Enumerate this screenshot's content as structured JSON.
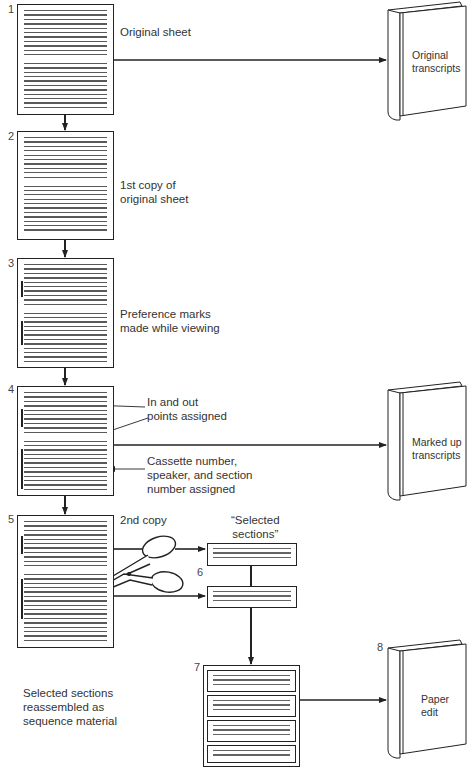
{
  "diagram": {
    "steps": [
      {
        "number": "1",
        "label": "Original sheet"
      },
      {
        "number": "2",
        "label_lines": [
          "1st copy of",
          "original sheet"
        ]
      },
      {
        "number": "3",
        "label_lines": [
          "Preference marks",
          "made while viewing"
        ]
      },
      {
        "number": "4",
        "annotations": [
          {
            "lines": [
              "In and out",
              "points assigned"
            ]
          },
          {
            "lines": [
              "Cassette number,",
              "speaker, and section",
              "number assigned"
            ]
          }
        ]
      },
      {
        "number": "5",
        "label": "2nd copy"
      },
      {
        "number": "6",
        "header_lines": [
          "“Selected",
          "sections”"
        ]
      },
      {
        "number": "7",
        "label_lines": [
          "Selected sections",
          "reassembled as",
          "sequence material"
        ]
      },
      {
        "number": "8"
      }
    ],
    "books": [
      {
        "id": "original-transcripts",
        "lines": [
          "Original",
          "transcripts"
        ]
      },
      {
        "id": "marked-up-transcripts",
        "lines": [
          "Marked up",
          "transcripts"
        ]
      },
      {
        "id": "paper-edit",
        "lines": [
          "Paper",
          "edit"
        ]
      }
    ],
    "icons": {
      "scissors": "scissors-icon"
    }
  }
}
